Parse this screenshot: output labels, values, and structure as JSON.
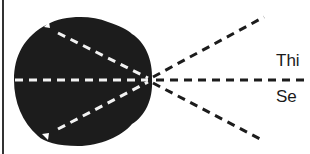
{
  "diagram": {
    "type": "optics-ray-diagram",
    "colors": {
      "background": "#ffffff",
      "body_fill": "#1c1c1c",
      "inner_rays": "#f2f2f2",
      "outer_rays": "#1c1c1c",
      "border": "#333333",
      "text": "#1a1a1a"
    },
    "focal_point": {
      "x": 150,
      "y": 80
    },
    "labels": {
      "top": "Thi",
      "bottom": "Se"
    },
    "inner_rays": [
      {
        "name": "upper",
        "from": [
          45,
          27
        ],
        "to": [
          148,
          78
        ]
      },
      {
        "name": "middle",
        "from": [
          14,
          80
        ],
        "to": [
          148,
          80
        ]
      },
      {
        "name": "lower",
        "from": [
          50,
          138
        ],
        "to": [
          148,
          82
        ]
      }
    ],
    "outer_rays": [
      {
        "name": "upper",
        "from": [
          152,
          78
        ],
        "to": [
          264,
          17
        ]
      },
      {
        "name": "middle",
        "from": [
          152,
          80
        ],
        "to": [
          310,
          80
        ]
      },
      {
        "name": "lower",
        "from": [
          152,
          82
        ],
        "to": [
          264,
          141
        ]
      }
    ]
  }
}
